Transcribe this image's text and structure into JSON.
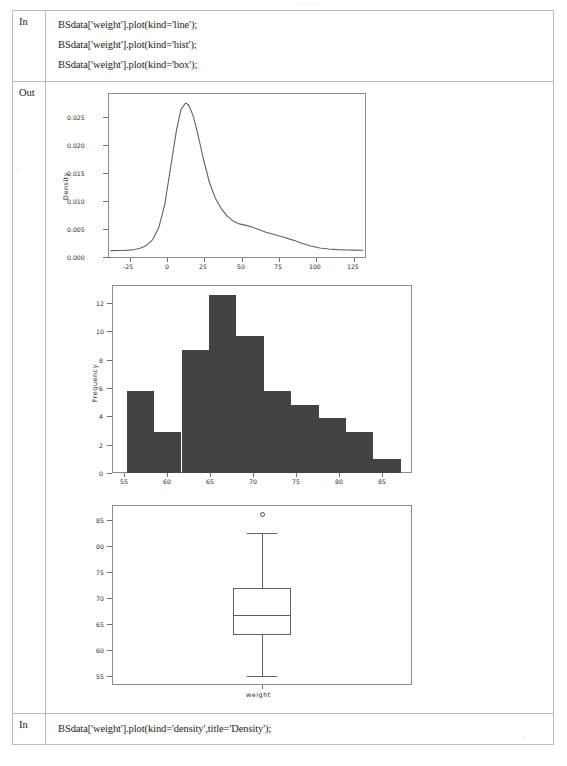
{
  "notebook": {
    "rows": [
      {
        "gutter": "In",
        "type": "code",
        "lines": [
          "BSdata['weight'].plot(kind='line');",
          "BSdata['weight'].plot(kind='hist');",
          "BSdata['weight'].plot(kind='box');"
        ]
      },
      {
        "gutter": "Out",
        "type": "figures"
      },
      {
        "gutter": "In",
        "type": "code",
        "lines": [
          "BSdata['weight'].plot(kind='density',title='Density');"
        ]
      }
    ]
  },
  "colors": {
    "table_border": "#b9bcbe",
    "axes_border": "#8a8d8f",
    "bar_fill": "#434343",
    "curve_stroke": "#5f6264",
    "box_stroke": "#5d6062",
    "text": "#2b2b2b"
  },
  "chart_data": [
    {
      "type": "line",
      "name": "density-plot",
      "title": "",
      "xlabel": "",
      "ylabel": "Density",
      "xlim": [
        -40,
        133
      ],
      "ylim": [
        -0.0012,
        0.0283
      ],
      "xticks": [
        -25,
        0,
        25,
        50,
        75,
        100,
        125
      ],
      "xticklabels": [
        "-25",
        "0",
        "25",
        "50",
        "75",
        "100",
        "125"
      ],
      "yticks": [
        0.0,
        0.005,
        0.01,
        0.015,
        0.02,
        0.025
      ],
      "yticklabels": [
        "0.000",
        "0.005",
        "0.010",
        "0.015",
        "0.020",
        "0.025"
      ],
      "grid": false,
      "legend": "none",
      "x": [
        -38,
        -34,
        -30,
        -26,
        -22,
        -18,
        -14,
        -10,
        -6,
        -2,
        2,
        6,
        9,
        12,
        14,
        17,
        20,
        24,
        28,
        32,
        36,
        40,
        44,
        48,
        52,
        56,
        60,
        66,
        72,
        78,
        84,
        90,
        96,
        102,
        108,
        114,
        120,
        126,
        131
      ],
      "y": [
        0.00012,
        0.00013,
        0.00015,
        0.0002,
        0.00032,
        0.00058,
        0.0011,
        0.0021,
        0.0042,
        0.0083,
        0.015,
        0.0218,
        0.0254,
        0.0265,
        0.0262,
        0.0243,
        0.0212,
        0.0165,
        0.0123,
        0.0095,
        0.0076,
        0.0063,
        0.0054,
        0.0049,
        0.00468,
        0.0044,
        0.004,
        0.0034,
        0.00295,
        0.0025,
        0.002,
        0.00145,
        0.00095,
        0.0006,
        0.0004,
        0.0003,
        0.00024,
        0.0002,
        0.00019
      ]
    },
    {
      "type": "bar",
      "name": "histogram-plot",
      "title": "",
      "xlabel": "",
      "ylabel": "Frequency",
      "xlim": [
        53.6,
        88.4
      ],
      "ylim": [
        0,
        13.65
      ],
      "xticks": [
        55,
        60,
        65,
        70,
        75,
        80,
        85
      ],
      "xticklabels": [
        "55",
        "60",
        "65",
        "70",
        "75",
        "80",
        "85"
      ],
      "yticks": [
        0,
        2,
        4,
        6,
        8,
        10,
        12
      ],
      "yticklabels": [
        "0",
        "2",
        "4",
        "6",
        "8",
        "10",
        "12"
      ],
      "grid": false,
      "legend": "none",
      "bin_edges": [
        55.2,
        58.4,
        61.6,
        64.8,
        68.0,
        71.2,
        74.4,
        77.6,
        80.8,
        84.0,
        87.2
      ],
      "values": [
        6,
        3,
        9,
        13,
        10,
        6,
        5,
        4,
        3,
        1
      ]
    },
    {
      "type": "box",
      "name": "boxplot",
      "title": "",
      "xlabel": "weight",
      "ylabel": "",
      "xticklabels": [
        "weight"
      ],
      "ylim": [
        53.2,
        88.6
      ],
      "yticks": [
        55,
        60,
        65,
        70,
        75,
        80,
        85
      ],
      "yticklabels": [
        "55",
        "60",
        "65",
        "70",
        "75",
        "80",
        "85"
      ],
      "grid": false,
      "legend": "none",
      "box": {
        "whisker_low": 55.0,
        "q1": 63.0,
        "median": 67.0,
        "q3": 72.2,
        "whisker_high": 83.0,
        "fliers": [
          86.8
        ]
      }
    }
  ]
}
